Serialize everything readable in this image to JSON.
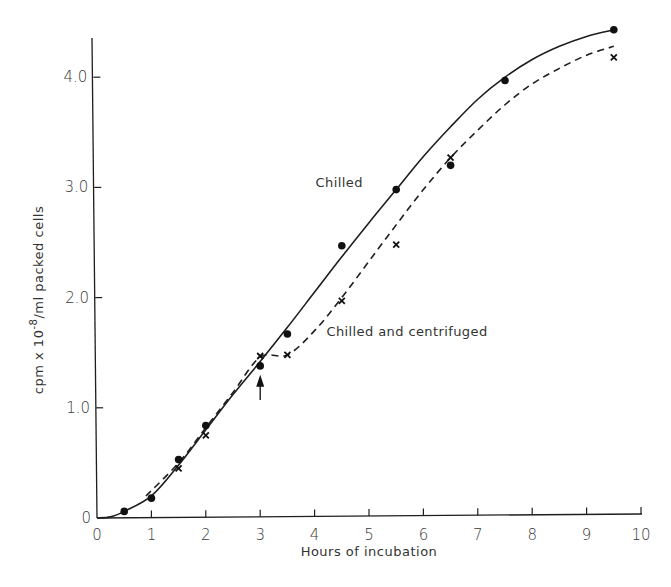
{
  "chart_data": {
    "type": "line",
    "title": "",
    "xlabel": "Hours of incubation",
    "ylabel": "cpm x 10^-8/ml packed cells",
    "ylabel_parts": {
      "pre": "cpm x 10",
      "sup": "-8",
      "post": "/ml packed cells"
    },
    "xlim": [
      0,
      10
    ],
    "ylim": [
      0,
      4.4
    ],
    "x_ticks": [
      "0",
      "1",
      "2",
      "3",
      "4",
      "5",
      "6",
      "7",
      "8",
      "9",
      "10"
    ],
    "y_ticks": [
      "0",
      "1.0",
      "2.0",
      "3.0",
      "4.0"
    ],
    "grid": false,
    "legend": "inline annotations",
    "series": [
      {
        "name": "Chilled",
        "marker": "filled-circle",
        "line_style": "solid",
        "points": [
          [
            0.5,
            0.06
          ],
          [
            1,
            0.18
          ],
          [
            1.5,
            0.53
          ],
          [
            2,
            0.84
          ],
          [
            3,
            1.38
          ],
          [
            3.5,
            1.67
          ],
          [
            4.5,
            2.47
          ],
          [
            5.5,
            2.98
          ],
          [
            6.5,
            3.2
          ],
          [
            7.5,
            3.97
          ],
          [
            9.5,
            4.43
          ]
        ],
        "curve": [
          [
            0,
            0
          ],
          [
            0.25,
            0.01
          ],
          [
            0.5,
            0.06
          ],
          [
            1,
            0.2
          ],
          [
            1.5,
            0.48
          ],
          [
            2,
            0.8
          ],
          [
            2.5,
            1.12
          ],
          [
            3,
            1.42
          ],
          [
            3.5,
            1.73
          ],
          [
            4,
            2.05
          ],
          [
            4.5,
            2.37
          ],
          [
            5,
            2.68
          ],
          [
            5.5,
            2.98
          ],
          [
            6,
            3.28
          ],
          [
            6.5,
            3.55
          ],
          [
            7,
            3.8
          ],
          [
            7.5,
            4.0
          ],
          [
            8,
            4.16
          ],
          [
            8.5,
            4.28
          ],
          [
            9,
            4.37
          ],
          [
            9.5,
            4.43
          ]
        ]
      },
      {
        "name": "Chilled and centrifuged",
        "marker": "x",
        "line_style": "dashed",
        "points": [
          [
            1.5,
            0.45
          ],
          [
            2,
            0.75
          ],
          [
            3,
            1.47
          ],
          [
            3.5,
            1.48
          ],
          [
            4.5,
            1.97
          ],
          [
            5.5,
            2.48
          ],
          [
            6.5,
            3.27
          ],
          [
            9.5,
            4.18
          ]
        ],
        "curve": [
          [
            0.9,
            0.2
          ],
          [
            1.5,
            0.5
          ],
          [
            2,
            0.82
          ],
          [
            2.5,
            1.14
          ],
          [
            3,
            1.46
          ],
          [
            3.5,
            1.48
          ],
          [
            4,
            1.7
          ],
          [
            4.5,
            2.0
          ],
          [
            5,
            2.33
          ],
          [
            5.5,
            2.66
          ],
          [
            6,
            2.98
          ],
          [
            6.5,
            3.27
          ],
          [
            7,
            3.52
          ],
          [
            7.5,
            3.75
          ],
          [
            8,
            3.94
          ],
          [
            8.5,
            4.08
          ],
          [
            9,
            4.2
          ],
          [
            9.5,
            4.28
          ]
        ]
      }
    ],
    "annotations": [
      {
        "text": "Chilled",
        "x": 4.0,
        "y": 3.05
      },
      {
        "text": "Chilled and centrifuged",
        "x": 4.2,
        "y": 1.7
      },
      {
        "text": "arrow",
        "x": 3.0,
        "y_from": 1.07,
        "y_to": 1.3
      }
    ]
  }
}
